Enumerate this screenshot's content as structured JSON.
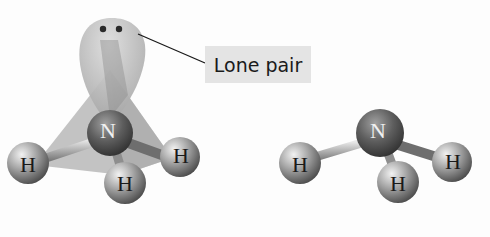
{
  "diagram": {
    "label": "Lone pair",
    "left_model": {
      "description": "Tetrahedral electron geometry showing lone pair lobe",
      "central_atom": "N",
      "atoms": [
        "H",
        "H",
        "H"
      ],
      "lone_pair_electrons": 2
    },
    "right_model": {
      "description": "Trigonal pyramidal molecular geometry",
      "central_atom": "N",
      "atoms": [
        "H",
        "H",
        "H"
      ]
    },
    "colors": {
      "background": "#fdfdfd",
      "tetrahedron_fill": "#b3b3b3",
      "lobe_fill": "#c2c2c2",
      "nitrogen": "#6a6a6a",
      "hydrogen": "#9a9a9a",
      "label_bg": "#e4e4e4",
      "leader_line": "#1a1a1a"
    }
  }
}
